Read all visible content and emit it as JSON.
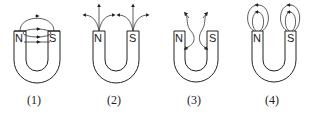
{
  "diagram": {
    "figures": [
      {
        "caption": "(1)",
        "north_label": "N",
        "south_label": "S",
        "pattern": "field lines loop from N over to S across the gap"
      },
      {
        "caption": "(2)",
        "north_label": "N",
        "south_label": "S",
        "pattern": "field lines radiate outward from both poles"
      },
      {
        "caption": "(3)",
        "north_label": "N",
        "south_label": "S",
        "pattern": "curved lines near inner faces of poles pointing inward/outward"
      },
      {
        "caption": "(4)",
        "north_label": "N",
        "south_label": "S",
        "pattern": "closed circular loops above each pole"
      }
    ],
    "colors": {
      "stroke": "#222222",
      "background": "#ffffff"
    }
  }
}
